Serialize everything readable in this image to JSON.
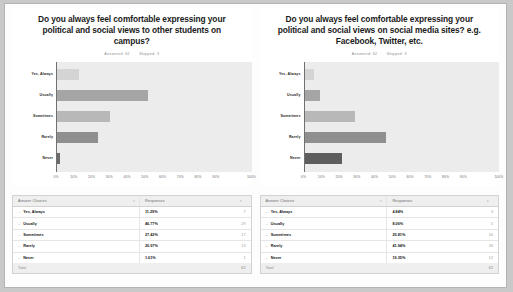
{
  "charts": [
    {
      "title": "Do you always feel comfortable expressing your political and social views to other students on campus?",
      "answered_label": "Answered: 62",
      "skipped_label": "Skipped: 3",
      "table": {
        "header_choice": "Answer Choices",
        "header_responses": "Responses",
        "total_label": "Total",
        "total_value": "62",
        "rows": [
          {
            "choice": "Yes, Always",
            "percent": "11.29%",
            "count": "7"
          },
          {
            "choice": "Usually",
            "percent": "46.77%",
            "count": "29"
          },
          {
            "choice": "Sometimes",
            "percent": "27.42%",
            "count": "17"
          },
          {
            "choice": "Rarely",
            "percent": "20.97%",
            "count": "13"
          },
          {
            "choice": "Never",
            "percent": "1.61%",
            "count": "1"
          }
        ]
      },
      "chart_data": {
        "type": "bar",
        "orientation": "horizontal",
        "title": "Do you always feel comfortable expressing your political and social views to other students on campus?",
        "categories": [
          "Yes, Always",
          "Usually",
          "Sometimes",
          "Rarely",
          "Never"
        ],
        "values": [
          11.29,
          46.77,
          27.42,
          20.97,
          1.61
        ],
        "counts": [
          7,
          29,
          17,
          13,
          1
        ],
        "colors": [
          "#d4d4d4",
          "#a5a5a5",
          "#b8b8b8",
          "#8f8f8f",
          "#6b6b6b"
        ],
        "xlabel": "",
        "ylabel": "",
        "xlim": [
          0,
          100
        ],
        "xticks": [
          "0%",
          "10%",
          "20%",
          "30%",
          "40%",
          "50%",
          "60%",
          "70%",
          "80%",
          "90%",
          "100%"
        ],
        "grid": false,
        "legend": false
      }
    },
    {
      "title": "Do you always feel comfortable expressing your political and social views on social media sites? e.g. Facebook, Twitter, etc.",
      "answered_label": "Answered: 62",
      "skipped_label": "Skipped: 3",
      "table": {
        "header_choice": "Answer Choices",
        "header_responses": "Responses",
        "total_label": "Total",
        "total_value": "62",
        "rows": [
          {
            "choice": "Yes, Always",
            "percent": "4.84%",
            "count": "3"
          },
          {
            "choice": "Usually",
            "percent": "8.06%",
            "count": "5"
          },
          {
            "choice": "Sometimes",
            "percent": "25.81%",
            "count": "16"
          },
          {
            "choice": "Rarely",
            "percent": "41.94%",
            "count": "26"
          },
          {
            "choice": "Never",
            "percent": "19.35%",
            "count": "12"
          }
        ]
      },
      "chart_data": {
        "type": "bar",
        "orientation": "horizontal",
        "title": "Do you always feel comfortable expressing your political and social views on social media sites? e.g. Facebook, Twitter, etc.",
        "categories": [
          "Yes, Always",
          "Usually",
          "Sometimes",
          "Rarely",
          "Never"
        ],
        "values": [
          4.84,
          8.06,
          25.81,
          41.94,
          19.35
        ],
        "counts": [
          3,
          5,
          16,
          26,
          12
        ],
        "colors": [
          "#d4d4d4",
          "#a5a5a5",
          "#b8b8b8",
          "#8f8f8f",
          "#5e5e5e"
        ],
        "xlabel": "",
        "ylabel": "",
        "xlim": [
          0,
          100
        ],
        "xticks": [
          "0%",
          "10%",
          "20%",
          "30%",
          "40%",
          "50%",
          "60%",
          "70%",
          "80%",
          "90%",
          "100%"
        ],
        "grid": false,
        "legend": false
      }
    }
  ],
  "icons": {
    "sort": "▾",
    "bullet": "–"
  }
}
